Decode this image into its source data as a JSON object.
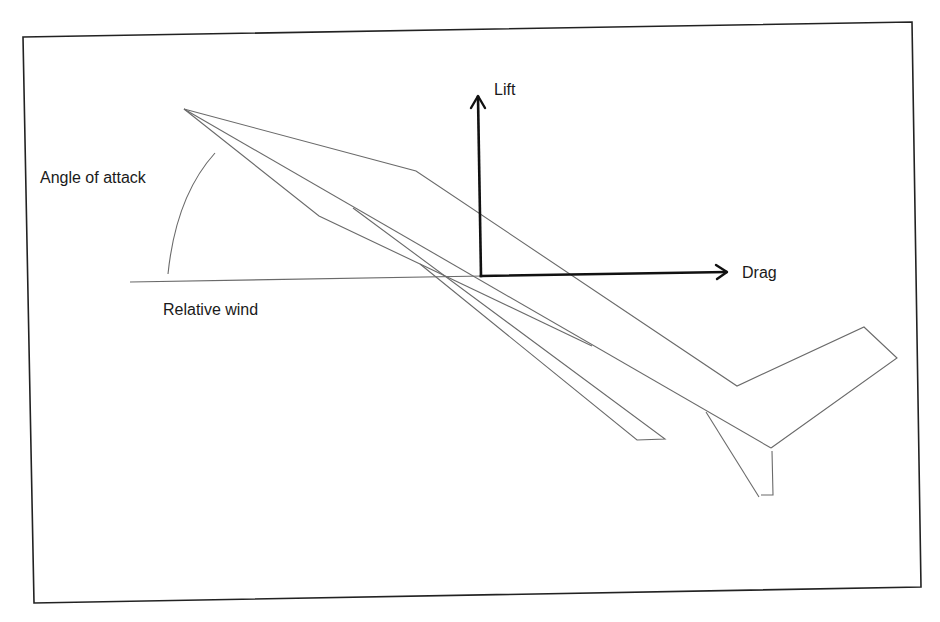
{
  "diagram": {
    "type": "aerodynamic-forces",
    "labels": {
      "angle_of_attack": "Angle of attack",
      "relative_wind": "Relative wind",
      "lift": "Lift",
      "drag": "Drag"
    },
    "elements": [
      {
        "name": "airplane-outline",
        "description": "Side view of airplane pitched nose-up"
      },
      {
        "name": "relative-wind-line",
        "description": "Horizontal line representing relative wind"
      },
      {
        "name": "angle-of-attack-arc",
        "description": "Arc between relative wind and airplane axis"
      },
      {
        "name": "lift-vector",
        "description": "Vertical arrow pointing up"
      },
      {
        "name": "drag-vector",
        "description": "Horizontal arrow pointing right"
      }
    ],
    "colors": {
      "outline": "#6a6a6a",
      "vectors": "#111111",
      "frame": "#222222",
      "background": "#ffffff"
    }
  }
}
